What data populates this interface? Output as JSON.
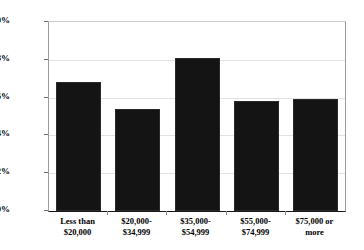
{
  "chart_data": {
    "type": "bar",
    "title": "",
    "subtitle": "",
    "xlabel": "",
    "ylabel": "",
    "categories": [
      "Less than\n$20,000",
      "$20,000-\n$34,999",
      "$35,000-\n$54,999",
      "$55,000-\n$74,999",
      "$75,000 or\nmore"
    ],
    "values": [
      6.8,
      5.4,
      8.1,
      5.8,
      5.9
    ],
    "value_labels": [
      "6.8%",
      "5.4%",
      "8.1%",
      "5.8%",
      "5.9%"
    ],
    "ylim": [
      0,
      10
    ],
    "ytick_values": [
      0,
      2,
      4,
      6,
      8,
      10
    ],
    "ytick_labels": [
      "0%",
      "2%",
      "4%",
      "6%",
      "8%",
      "10%"
    ],
    "grid": true,
    "legend": null,
    "legend_position": "none",
    "bar_color": "#141414",
    "gridline_color": "#e2e2e2",
    "axis_color": "#1a1a1a",
    "plot_background": "#ffffff"
  }
}
